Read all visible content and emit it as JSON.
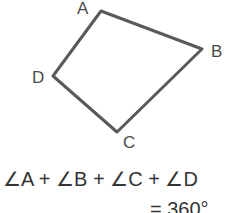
{
  "diagram": {
    "shape": "quadrilateral",
    "vertices": [
      {
        "label": "A",
        "x": 101,
        "y": 11
      },
      {
        "label": "B",
        "x": 202,
        "y": 49
      },
      {
        "label": "C",
        "x": 117,
        "y": 132
      },
      {
        "label": "D",
        "x": 53,
        "y": 76
      }
    ],
    "stroke_color": "#555555"
  },
  "equation": {
    "line1": "∠A + ∠B + ∠C + ∠D",
    "line2": "= 360°"
  }
}
